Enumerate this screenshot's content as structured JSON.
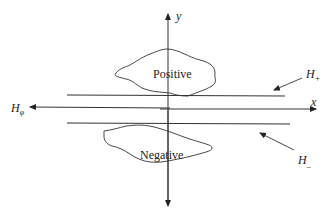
{
  "diagram": {
    "axes": {
      "x_label": "x",
      "y_label": "y"
    },
    "regions": {
      "positive": "Positive",
      "negative": "Negative"
    },
    "hyperplanes": {
      "h_plus": {
        "base": "H",
        "sub": "+"
      },
      "h_zero": {
        "base": "H",
        "sub": "φ"
      },
      "h_minus": {
        "base": "H",
        "sub": "_"
      }
    },
    "colors": {
      "stroke": "#333333",
      "text": "#222222"
    }
  }
}
